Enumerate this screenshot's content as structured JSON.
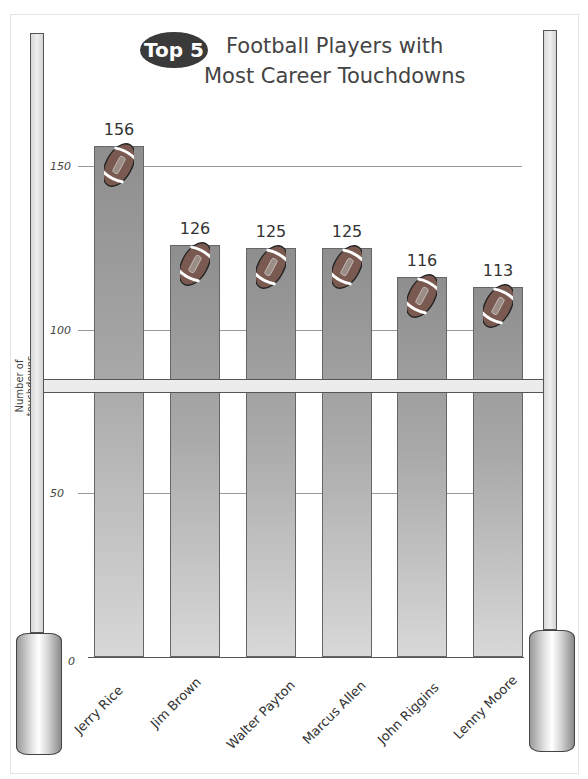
{
  "title": {
    "badge": "Top 5",
    "line1": "Football Players with",
    "line2": "Most Career Touchdowns"
  },
  "axis": {
    "ylabel": "Number of touchdowns",
    "ticks": [
      "0",
      "50",
      "100",
      "150"
    ]
  },
  "bars": [
    {
      "label": "Jerry Rice",
      "value": "156"
    },
    {
      "label": "Jim Brown",
      "value": "126"
    },
    {
      "label": "Walter Payton",
      "value": "125"
    },
    {
      "label": "Marcus Allen",
      "value": "125"
    },
    {
      "label": "John Riggins",
      "value": "116"
    },
    {
      "label": "Lenny Moore",
      "value": "113"
    }
  ],
  "chart_data": {
    "type": "bar",
    "categories": [
      "Jerry Rice",
      "Jim Brown",
      "Walter Payton",
      "Marcus Allen",
      "John Riggins",
      "Lenny Moore"
    ],
    "values": [
      156,
      126,
      125,
      125,
      116,
      113
    ],
    "xlabel": "",
    "ylabel": "Number of touchdowns",
    "ylim": [
      0,
      160
    ],
    "yticks": [
      0,
      50,
      100,
      150
    ],
    "grid": true,
    "legend": "none",
    "annotations": "Data labels above each bar; football icon on top of each bar; goal-post decoration frames the chart"
  }
}
